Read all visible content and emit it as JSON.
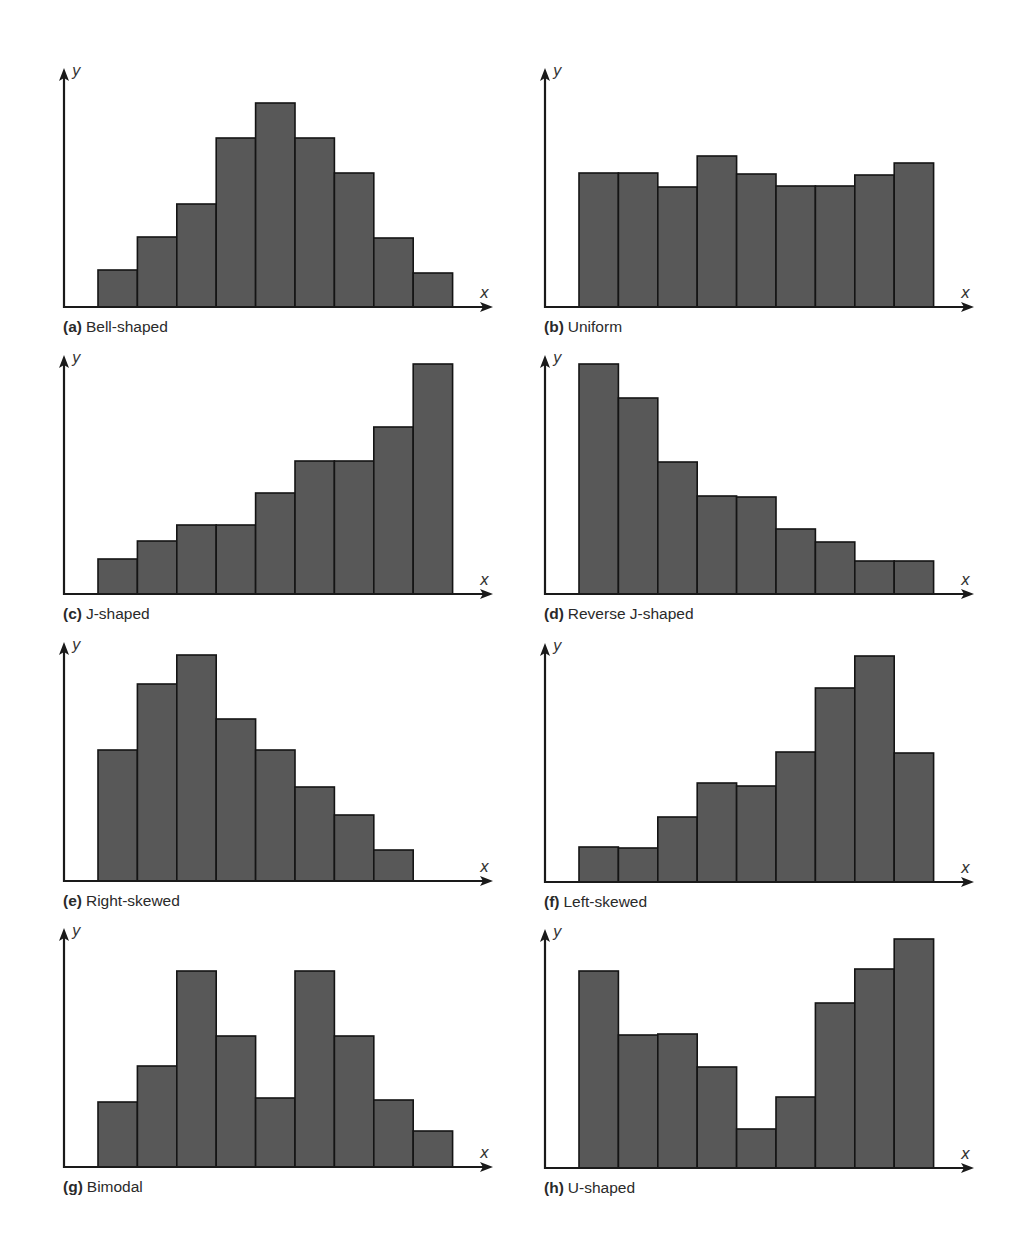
{
  "figure": {
    "bar_fill": "#585858",
    "bar_stroke": "#141414",
    "axis_color": "#1a1a1a",
    "caption_color": "#2a2a2a"
  },
  "chart_data": [
    {
      "id": "a",
      "type": "bar",
      "tag": "(a)",
      "title": "Bell-shaped",
      "xlabel": "x",
      "ylabel": "y",
      "grid": false,
      "values": [
        37,
        70,
        103,
        169,
        204,
        169,
        134,
        69,
        34
      ]
    },
    {
      "id": "b",
      "type": "bar",
      "tag": "(b)",
      "title": "Uniform",
      "xlabel": "x",
      "ylabel": "y",
      "grid": false,
      "values": [
        134,
        134,
        120,
        151,
        133,
        121,
        121,
        132,
        144
      ]
    },
    {
      "id": "c",
      "type": "bar",
      "tag": "(c)",
      "title": "J-shaped",
      "xlabel": "x",
      "ylabel": "y",
      "grid": false,
      "values": [
        35,
        53,
        69,
        69,
        101,
        133,
        133,
        167,
        230
      ]
    },
    {
      "id": "d",
      "type": "bar",
      "tag": "(d)",
      "title": "Reverse J-shaped",
      "xlabel": "x",
      "ylabel": "y",
      "grid": false,
      "values": [
        230,
        196,
        132,
        98,
        97,
        65,
        52,
        33,
        33
      ]
    },
    {
      "id": "e",
      "type": "bar",
      "tag": "(e)",
      "title": "Right-skewed",
      "xlabel": "x",
      "ylabel": "y",
      "grid": false,
      "values": [
        131,
        197,
        226,
        162,
        131,
        94,
        66,
        31
      ]
    },
    {
      "id": "f",
      "type": "bar",
      "tag": "(f)",
      "title": "Left-skewed",
      "xlabel": "x",
      "ylabel": "y",
      "grid": false,
      "values": [
        35,
        34,
        65,
        99,
        96,
        130,
        194,
        226,
        129
      ]
    },
    {
      "id": "g",
      "type": "bar",
      "tag": "(g)",
      "title": "Bimodal",
      "xlabel": "x",
      "ylabel": "y",
      "grid": false,
      "values": [
        65,
        101,
        196,
        131,
        69,
        196,
        131,
        67,
        36
      ]
    },
    {
      "id": "h",
      "type": "bar",
      "tag": "(h)",
      "title": "U-shaped",
      "xlabel": "x",
      "ylabel": "y",
      "grid": false,
      "values": [
        197,
        133,
        134,
        101,
        39,
        71,
        165,
        199,
        229
      ]
    }
  ]
}
